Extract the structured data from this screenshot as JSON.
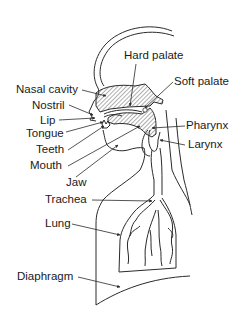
{
  "diagram": {
    "labels": {
      "hard_palate": "Hard palate",
      "soft_palate": "Soft palate",
      "nasal_cavity": "Nasal cavity",
      "nostril": "Nostril",
      "lip": "Lip",
      "tongue": "Tongue",
      "teeth": "Teeth",
      "mouth": "Mouth",
      "jaw": "Jaw",
      "trachea": "Trachea",
      "lung": "Lung",
      "diaphragm": "Diaphragm",
      "pharynx": "Pharynx",
      "larynx": "Larynx"
    },
    "colors": {
      "line": "#2a2a2a",
      "text": "#1a1a1a",
      "background": "#ffffff"
    }
  }
}
